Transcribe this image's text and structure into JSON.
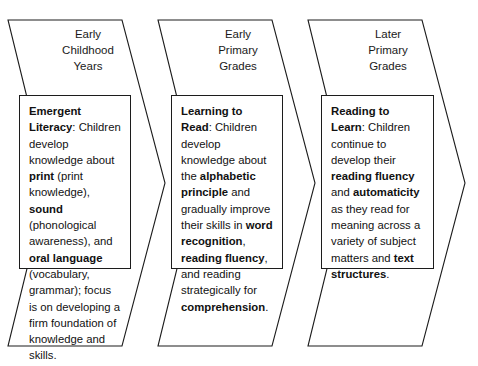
{
  "diagram": {
    "shape": "right-pointing chevron arrows",
    "colors": {
      "background": "#ffffff",
      "outline": "#1c1c1c",
      "text": "#111111"
    },
    "stages": [
      {
        "id": "early-childhood-years",
        "header": "Early\nChildhood\nYears",
        "heading": "Emergent Literacy",
        "heading_suffix": ":",
        "body_runs": [
          {
            "text": "Children develop knowledge about ",
            "bold": false
          },
          {
            "text": "print",
            "bold": true
          },
          {
            "text": " (print knowledge), ",
            "bold": false
          },
          {
            "text": "sound",
            "bold": true
          },
          {
            "text": " (phonological awareness), and ",
            "bold": false
          },
          {
            "text": "oral language",
            "bold": true
          },
          {
            "text": " (vocabulary, grammar); focus is on developing a firm foundation of knowledge and skills.",
            "bold": false
          }
        ]
      },
      {
        "id": "early-primary-grades",
        "header": "Early\nPrimary\nGrades",
        "heading": "Learning to Read",
        "heading_suffix": ":",
        "body_runs": [
          {
            "text": "Children develop knowledge about the ",
            "bold": false
          },
          {
            "text": "alphabetic principle",
            "bold": true
          },
          {
            "text": " and gradually improve their skills in ",
            "bold": false
          },
          {
            "text": "word recognition",
            "bold": true
          },
          {
            "text": ", ",
            "bold": false
          },
          {
            "text": "reading fluency",
            "bold": true
          },
          {
            "text": ", and reading strategically for ",
            "bold": false
          },
          {
            "text": "comprehension",
            "bold": true
          },
          {
            "text": ".",
            "bold": false
          }
        ]
      },
      {
        "id": "later-primary-grades",
        "header": "Later\nPrimary\nGrades",
        "heading": "Reading to Learn",
        "heading_suffix": ":",
        "body_runs": [
          {
            "text": "Children continue to develop their ",
            "bold": false
          },
          {
            "text": "reading fluency",
            "bold": true
          },
          {
            "text": " and ",
            "bold": false
          },
          {
            "text": "automaticity",
            "bold": true
          },
          {
            "text": " as they read for meaning across a variety of subject matters and ",
            "bold": false
          },
          {
            "text": "text structures",
            "bold": true
          },
          {
            "text": ".",
            "bold": false
          }
        ]
      }
    ]
  }
}
